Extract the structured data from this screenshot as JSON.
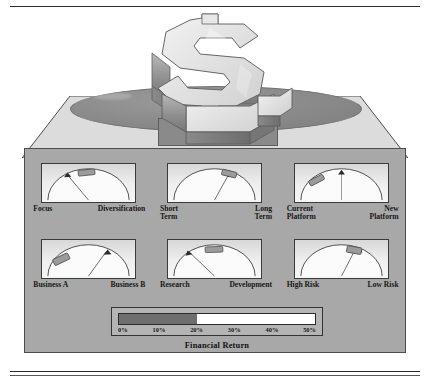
{
  "figure": {
    "title_visible": false,
    "illustration": {
      "icon": "dollar-sign-3d",
      "plinth": "ellipse-disc",
      "base": "slab"
    }
  },
  "colors": {
    "panel_bg": "#a8a8a8",
    "gauge_face": "#efefef",
    "marker": "#7a7a7a",
    "ink": "#171717",
    "legend_fill": "#6e6e6e",
    "legend_empty": "#ffffff"
  },
  "gauges": [
    {
      "id": "focus-diversification",
      "left_label": "Focus",
      "right_label": "Diversification",
      "needle_pct": 22,
      "block_start_pct": 30,
      "block_end_pct": 45,
      "block_center_pct": 37
    },
    {
      "id": "short-long-term",
      "left_label": "Short\nTerm",
      "left_label_line1": "Short",
      "left_label_line2": "Term",
      "right_label": "Long\nTerm",
      "right_label_line1": "Long",
      "right_label_line2": "Term",
      "needle_pct": 63,
      "block_start_pct": 57,
      "block_end_pct": 70,
      "block_center_pct": 63
    },
    {
      "id": "current-new-platform",
      "left_label_line1": "Current",
      "left_label_line2": "Platform",
      "right_label_line1": "New",
      "right_label_line2": "Platform",
      "needle_pct": 50,
      "block_start_pct": 14,
      "block_end_pct": 27,
      "block_center_pct": 20
    },
    {
      "id": "business-a-b",
      "left_label": "Business A",
      "right_label": "Business B",
      "needle_pct": 66,
      "block_start_pct": 11,
      "block_end_pct": 26,
      "block_center_pct": 18
    },
    {
      "id": "research-development",
      "left_label": "Research",
      "right_label": "Development",
      "needle_pct": 15,
      "block_start_pct": 40,
      "block_end_pct": 56,
      "block_center_pct": 48
    },
    {
      "id": "high-low-risk",
      "left_label": "High Risk",
      "right_label": "Low Risk",
      "needle_pct": 64,
      "block_start_pct": 55,
      "block_end_pct": 68,
      "block_center_pct": 61
    }
  ],
  "legend": {
    "title": "Financial Return",
    "ticks": [
      "0%",
      "10%",
      "20%",
      "30%",
      "40%",
      "50%"
    ],
    "min": 0,
    "max": 50,
    "fill_value": 20,
    "fill_pct": 40
  },
  "chart_data": {
    "type": "bar",
    "title": "Financial Return",
    "categories": [
      "0%",
      "10%",
      "20%",
      "30%",
      "40%",
      "50%"
    ],
    "values": [
      0,
      10,
      20,
      30,
      40,
      50
    ],
    "xlabel": "Financial Return",
    "ylabel": "",
    "xlim": [
      0,
      50
    ],
    "grid": false,
    "legend_position": "none",
    "annotations": [
      "Focus vs Diversification",
      "Short Term vs Long Term",
      "Current Platform vs New Platform",
      "Business A vs Business B",
      "Research vs Development",
      "High Risk vs Low Risk"
    ]
  }
}
